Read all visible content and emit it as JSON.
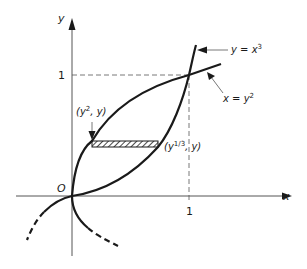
{
  "diagram": {
    "type": "region-between-curves",
    "axes": {
      "x_label": "x",
      "y_label": "y",
      "origin_label": "O",
      "x_tick_label": "1",
      "y_tick_label": "1"
    },
    "curves": [
      {
        "name": "y = x^3",
        "label_base": "y = x",
        "label_sup": "3",
        "style": "solid-in-view, dashed-extension"
      },
      {
        "name": "x = y^2",
        "label_base": "x = y",
        "label_sup": "2",
        "style": "solid, dashed lower branch"
      }
    ],
    "points": {
      "left_label_base": "(y",
      "left_label_sup": "2",
      "left_label_tail": ", y)",
      "right_label_base": "(y",
      "right_label_sup": "1/3",
      "right_label_tail": ", y)"
    },
    "strip": {
      "description": "horizontal hatched strip between the curves",
      "fill": "hatched"
    },
    "intersection": {
      "x": 1,
      "y": 1,
      "guides": "dashed"
    },
    "colors": {
      "ink": "#1a1a1a",
      "axis": "#555555",
      "background": "#ffffff"
    }
  }
}
